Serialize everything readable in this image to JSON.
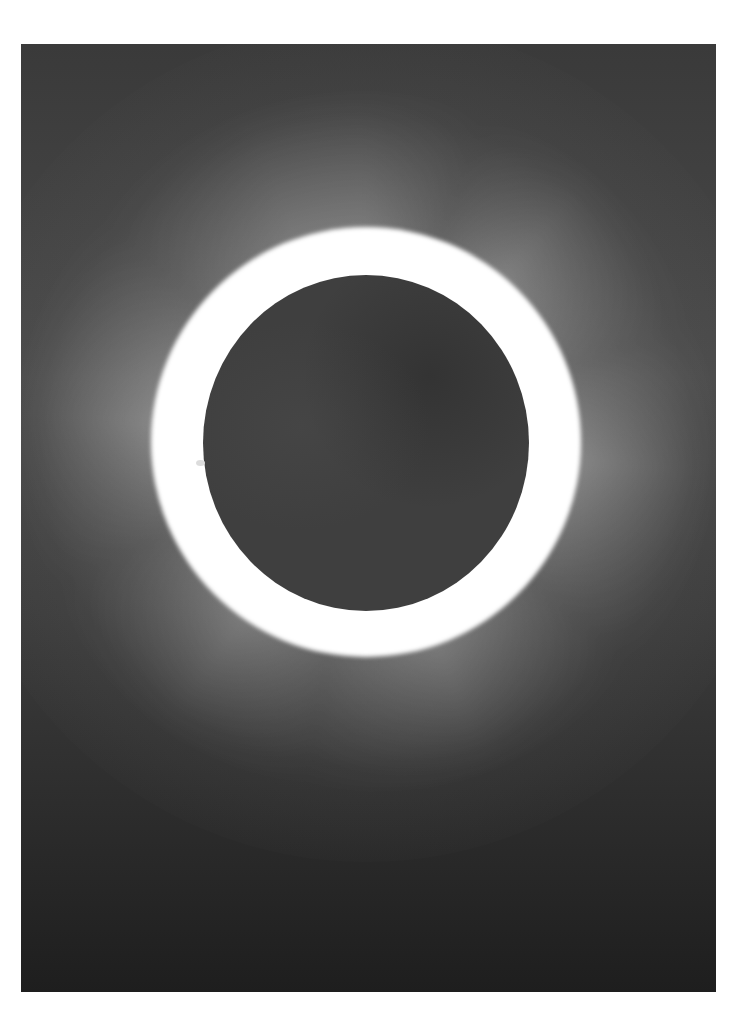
{
  "image": {
    "subject": "Total solar eclipse",
    "description": "Black-and-white photograph of a total solar eclipse: dark lunar disc surrounded by bright white corona with radial streamers against a dark gray sky, on a white page border.",
    "elements": [
      {
        "name": "moon-disc",
        "description": "Dark gray circular disc near center-upper area"
      },
      {
        "name": "corona",
        "description": "Bright white glow with radial streamers around disc"
      },
      {
        "name": "prominence",
        "description": "Small bright feature on left limb"
      }
    ],
    "colors": {
      "page_background": "#ffffff",
      "sky": "#2a2a2a",
      "moon": "#3f3f3f",
      "corona": "#ffffff"
    }
  }
}
